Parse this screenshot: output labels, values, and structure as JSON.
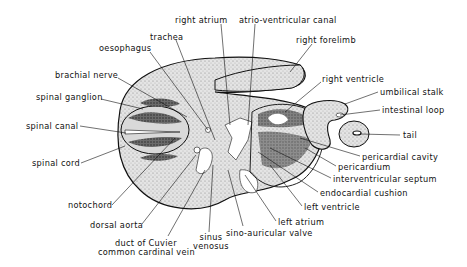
{
  "diagram": {
    "labels": [
      {
        "id": "right_atrium",
        "text": "right atrium",
        "x": 175,
        "y": 16
      },
      {
        "id": "atrio_ventricular_canal",
        "text": "atrio-ventricular canal",
        "x": 239,
        "y": 16
      },
      {
        "id": "trachea",
        "text": "trachea",
        "x": 150,
        "y": 33
      },
      {
        "id": "right_forelimb",
        "text": "right forelimb",
        "x": 296,
        "y": 36
      },
      {
        "id": "oesophagus",
        "text": "oesophagus",
        "x": 99,
        "y": 44
      },
      {
        "id": "brachial_nerve",
        "text": "brachial nerve",
        "x": 55,
        "y": 71
      },
      {
        "id": "right_ventricle",
        "text": "right ventricle",
        "x": 322,
        "y": 75
      },
      {
        "id": "spinal_ganglion",
        "text": "spinal ganglion",
        "x": 36,
        "y": 93
      },
      {
        "id": "umbilical_stalk",
        "text": "umbilical stalk",
        "x": 380,
        "y": 89
      },
      {
        "id": "intestinal_loop",
        "text": "intestinal loop",
        "x": 382,
        "y": 107
      },
      {
        "id": "spinal_canal",
        "text": "spinal canal",
        "x": 26,
        "y": 122
      },
      {
        "id": "tail",
        "text": "tail",
        "x": 403,
        "y": 132
      },
      {
        "id": "spinal_cord",
        "text": "spinal cord",
        "x": 32,
        "y": 159
      },
      {
        "id": "pericardial_cavity",
        "text": "pericardial cavity",
        "x": 362,
        "y": 153
      },
      {
        "id": "pericardium",
        "text": "pericardium",
        "x": 338,
        "y": 163
      },
      {
        "id": "interventricular_septum",
        "text": "interventricular septum",
        "x": 333,
        "y": 175
      },
      {
        "id": "endocardial_cushion",
        "text": "endocardial cushion",
        "x": 320,
        "y": 189
      },
      {
        "id": "notochord",
        "text": "notochord",
        "x": 68,
        "y": 201
      },
      {
        "id": "left_ventricle",
        "text": "left ventricle",
        "x": 304,
        "y": 203
      },
      {
        "id": "dorsal_aorta",
        "text": "dorsal aorta",
        "x": 90,
        "y": 221
      },
      {
        "id": "left_atrium",
        "text": "left atrium",
        "x": 278,
        "y": 218
      },
      {
        "id": "sino_auricular_valve",
        "text": "sino-auricular valve",
        "x": 226,
        "y": 228
      },
      {
        "id": "sinus_venosus",
        "text": "sinus\nvenosus",
        "x": 193,
        "y": 233
      },
      {
        "id": "duct_of_cuvier",
        "text": "duct of Cuvier",
        "x": 115,
        "y": 239
      },
      {
        "id": "common_cardinal_vein",
        "text": "common cardinal vein",
        "x": 98,
        "y": 248
      }
    ]
  }
}
